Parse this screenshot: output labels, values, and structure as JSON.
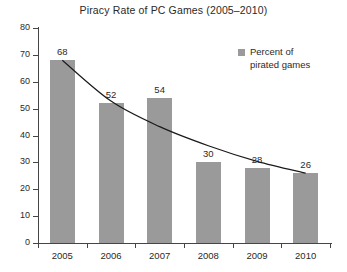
{
  "chart_data": {
    "type": "bar",
    "title": "Piracy Rate of PC Games (2005–2010)",
    "categories": [
      "2005",
      "2006",
      "2007",
      "2008",
      "2009",
      "2010"
    ],
    "values": [
      68,
      52,
      54,
      30,
      28,
      26
    ],
    "series": [
      {
        "name": "Percent of pirated games",
        "values": [
          68,
          52,
          54,
          30,
          28,
          26
        ]
      },
      {
        "name": "trend",
        "type": "line",
        "values": [
          68,
          52.8,
          43.3,
          36.2,
          30.4,
          26
        ]
      }
    ],
    "xlabel": "",
    "ylabel": "",
    "ylim": [
      0,
      80
    ],
    "yticks": [
      0,
      10,
      20,
      30,
      40,
      50,
      60,
      70,
      80
    ],
    "grid": false,
    "legend": {
      "position": "top-right",
      "entries": [
        "Percent of\npirated games"
      ]
    },
    "colors": {
      "bar": "#9a9a9a",
      "trend_line": "#1a1a1a",
      "axis": "#454545",
      "text": "#2a2a2a",
      "background": "#ffffff"
    }
  },
  "legend": {
    "label": "Percent of\npirated games"
  }
}
